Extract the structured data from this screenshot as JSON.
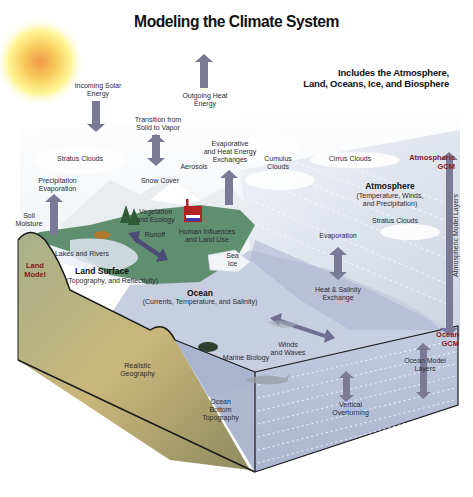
{
  "title": "Modeling the Climate System",
  "subtitle": "Includes the Atmosphere,\nLand, Oceans, Ice, and Biosphere",
  "colors": {
    "arrow": "#7a7a96",
    "arrow_dark": "#4d4a78",
    "gcm_label": "#8b1a1a",
    "land_green": "#5f8f6e",
    "land_tan": "#c7b77c",
    "ocean_face": "#b8c2d8",
    "ocean_surface": "#c9d0e0",
    "sky": "#e8edf3",
    "sun_core": "#f29a4a",
    "sun_glow": "#fff27a"
  },
  "atmosphere": {
    "incoming_solar": "Incoming Solar\nEnergy",
    "outgoing_heat": "Outgoing Heat\nEnergy",
    "transition": "Transition from\nSolid to Vapor",
    "stratus_clouds_left": "Stratus Clouds",
    "precipitation": "Precipitation\nEvaporation",
    "snow_cover": "Snow Cover",
    "aerosols": "Aerosols",
    "evap_heat": "Evaporative\nand Heat Energy\nExchanges",
    "cumulus": "Cumulus\nClouds",
    "cirrus": "Cirrus Clouds",
    "gcm": "Atmospheric\nGCM",
    "atmosphere_title": "Atmosphere",
    "atmosphere_desc": "(Temperature, Winds,\nand Precipitation)",
    "stratus_clouds_right": "Stratus Clouds",
    "model_layers": "Atmospheric Model Layers",
    "evaporation": "Evaporation",
    "heat_salinity": "Heat & Salinity\nExchange"
  },
  "land": {
    "soil_moisture": "Soil\nMoisture",
    "vegetation": "Vegetation\nand Ecology",
    "human": "Human Influences\nand Land Use",
    "runoff": "Runoff",
    "lakes": "Lakes and Rivers",
    "land_model": "Land\nModel",
    "surface_title": "Land Surface",
    "surface_desc": "(Topography, and Reflectivity)",
    "geography": "Realistic\nGeography"
  },
  "ocean": {
    "sea_ice": "Sea\nIce",
    "title": "Ocean",
    "desc": "(Currents, Temperature, and Salinity)",
    "winds": "Winds\nand Waves",
    "marine": "Marine Biology",
    "gcm": "Ocean\nGCM",
    "model_layers": "Ocean Model\nLayers",
    "overturning": "Vertical\nOverturning",
    "bottom": "Ocean\nBottom\nTopography"
  }
}
